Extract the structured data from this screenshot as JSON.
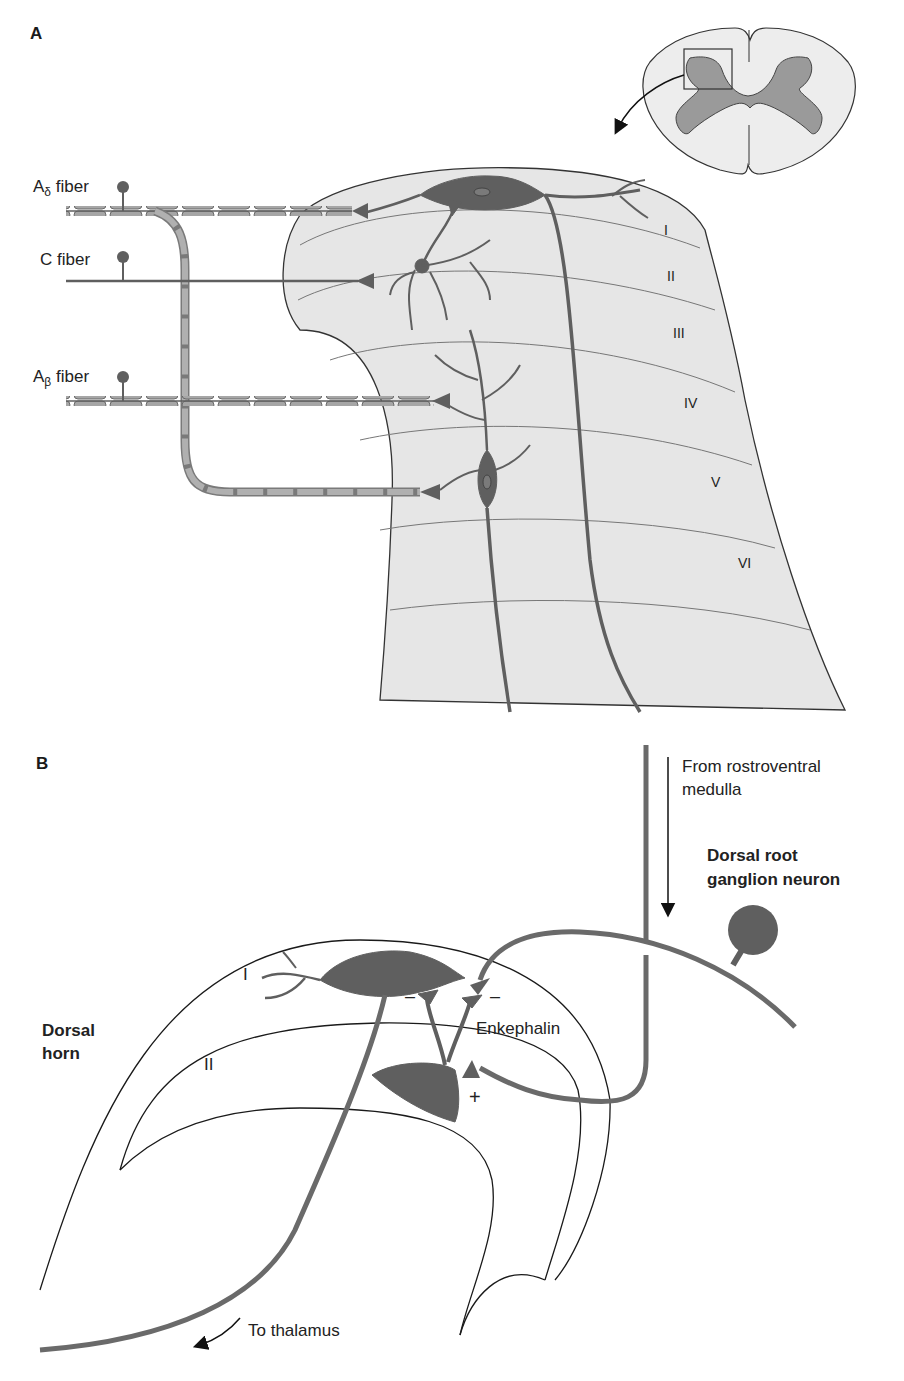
{
  "panel_a": {
    "letter": "A",
    "fibers": [
      {
        "name": "A",
        "subscript": "δ",
        "suffix": " fiber"
      },
      {
        "name": "C fiber",
        "subscript": "",
        "suffix": ""
      },
      {
        "name": "A",
        "subscript": "β",
        "suffix": " fiber"
      }
    ],
    "laminae": [
      "I",
      "II",
      "III",
      "IV",
      "V",
      "VI"
    ],
    "inset": "spinal-cord-cross-section"
  },
  "panel_b": {
    "letter": "B",
    "labels": {
      "descending": "From rostroventral\nmedulla",
      "descending_line1": "From rostroventral",
      "descending_line2": "medulla",
      "drg_line1": "Dorsal root",
      "drg_line2": "ganglion neuron",
      "dorsal_horn_line1": "Dorsal",
      "dorsal_horn_line2": "horn",
      "lamina_1": "I",
      "lamina_2": "II",
      "enkephalin": "Enkephalin",
      "plus": "+",
      "minus": "–",
      "thalamus": "To thalamus"
    }
  },
  "colors": {
    "gray_matter_fill": "#d8d8d8",
    "cord_fill": "#ededed",
    "neuron": "#5f5f5f",
    "myelin": "#9a9a9a",
    "line": "#2a2a2a"
  }
}
